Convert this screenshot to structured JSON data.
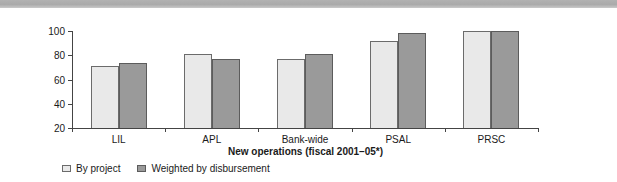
{
  "banner": {
    "name": "top-gray-band",
    "color": "#aaaaaa"
  },
  "chart_data": {
    "type": "bar",
    "title": "",
    "xlabel": "New operations (fiscal 2001–05*)",
    "ylabel": "Percent satisfactory outcome",
    "categories": [
      "LIL",
      "APL",
      "Bank-wide",
      "PSAL",
      "PRSC"
    ],
    "series": [
      {
        "name": "By project",
        "color": "#e9e9e9",
        "values": [
          71,
          81,
          77,
          92,
          100
        ]
      },
      {
        "name": "Weighted by disbursement",
        "color": "#9a9a9a",
        "values": [
          74,
          77,
          81,
          98,
          100
        ]
      }
    ],
    "ylim": [
      20,
      100
    ],
    "yticks": [
      20,
      40,
      60,
      80,
      100
    ],
    "ytick_labels": [
      "20",
      "40",
      "60",
      "80",
      "100"
    ],
    "grid": false,
    "legend_position": "bottom-left"
  }
}
